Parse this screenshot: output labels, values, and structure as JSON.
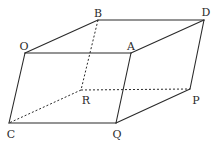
{
  "figure": {
    "type": "parallelepiped",
    "vertices": {
      "O": {
        "label": "O",
        "x": 25,
        "y": 53,
        "lx": 24,
        "ly": 50
      },
      "A": {
        "label": "A",
        "x": 131,
        "y": 53,
        "lx": 131,
        "ly": 50
      },
      "B": {
        "label": "B",
        "x": 98,
        "y": 20,
        "lx": 98,
        "ly": 17
      },
      "D": {
        "label": "D",
        "x": 204,
        "y": 20,
        "lx": 206,
        "ly": 16
      },
      "C": {
        "label": "C",
        "x": 9,
        "y": 123,
        "lx": 11,
        "ly": 138
      },
      "Q": {
        "label": "Q",
        "x": 116,
        "y": 123,
        "lx": 117,
        "ly": 138
      },
      "R": {
        "label": "R",
        "x": 81,
        "y": 90,
        "lx": 86,
        "ly": 104
      },
      "P": {
        "label": "P",
        "x": 190,
        "y": 89,
        "lx": 196,
        "ly": 104
      }
    },
    "solid_edges": [
      [
        "O",
        "B"
      ],
      [
        "B",
        "D"
      ],
      [
        "O",
        "A"
      ],
      [
        "A",
        "D"
      ],
      [
        "D",
        "P"
      ],
      [
        "O",
        "C"
      ],
      [
        "A",
        "Q"
      ],
      [
        "C",
        "Q"
      ],
      [
        "Q",
        "P"
      ]
    ],
    "dashed_edges": [
      [
        "B",
        "R"
      ],
      [
        "R",
        "C"
      ],
      [
        "R",
        "P"
      ]
    ]
  },
  "labels": {
    "O": "O",
    "A": "A",
    "B": "B",
    "D": "D",
    "C": "C",
    "Q": "Q",
    "R": "R",
    "P": "P"
  }
}
